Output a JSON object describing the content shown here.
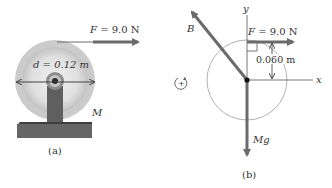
{
  "panel_a": {
    "caption": "(a)",
    "force_label_sym": "F",
    "force_label_eq": " = 9.0 N",
    "diameter_label": "d = 0.12 m",
    "mass_label": "M"
  },
  "panel_b": {
    "caption": "(b)",
    "force_label_sym": "F",
    "force_label_eq": " = 9.0 N",
    "distance_label": "0.060 m",
    "x_axis_label": "x",
    "y_axis_label": "y",
    "bearing_force_label": "B",
    "weight_label": "Mg",
    "rotation_sign": "+"
  },
  "colors": {
    "arrow": "#6b6b6b",
    "pulley_outer": "#c9c9c9",
    "pulley_inner": "#e2e2e2",
    "stand": "#5e5e5e",
    "base_top": "#4a4a4a",
    "text": "#333333",
    "circle_outline": "#a8a8a8"
  }
}
